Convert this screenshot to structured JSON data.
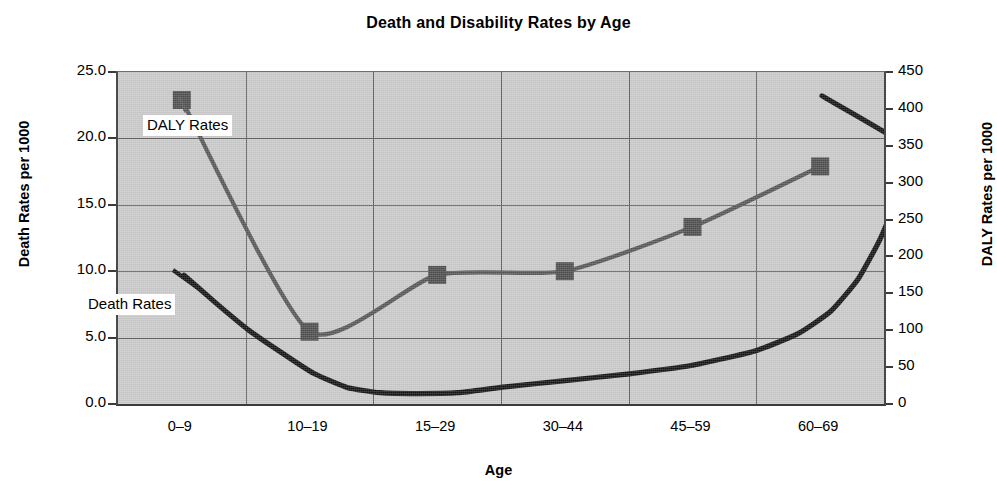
{
  "chart_data": {
    "type": "line",
    "title": "Death and Disability Rates by Age",
    "xlabel": "Age",
    "ylabel": "Death Rates per 1000",
    "y2label": "DALY Rates per 1000",
    "categories": [
      "0–9",
      "10–19",
      "15–29",
      "30–44",
      "45–59",
      "60–69"
    ],
    "ylim": [
      0,
      25
    ],
    "y2lim": [
      0,
      450
    ],
    "yticks": [
      "0.0",
      "5.0",
      "10.0",
      "15.0",
      "20.0",
      "25.0"
    ],
    "ytick_values": [
      0,
      5,
      10,
      15,
      20,
      25
    ],
    "y2ticks": [
      "0",
      "50",
      "100",
      "150",
      "200",
      "250",
      "300",
      "350",
      "400",
      "450"
    ],
    "y2tick_values": [
      0,
      50,
      100,
      150,
      200,
      250,
      300,
      350,
      400,
      450
    ],
    "grid": true,
    "legend_position": "inline-annotations",
    "series": [
      {
        "name": "DALY Rates",
        "axis": "right",
        "color": "#565656",
        "marker": "square",
        "values": [
          412,
          98,
          175,
          180,
          240,
          322
        ]
      },
      {
        "name": "Death Rates",
        "axis": "left",
        "color": "#141414",
        "marker": "none",
        "values": [
          9.7,
          1.3,
          0.8,
          2.6,
          5.3,
          23.2
        ]
      }
    ],
    "annotations": [
      {
        "text": "DALY Rates",
        "series": "DALY Rates"
      },
      {
        "text": "Death Rates",
        "series": "Death Rates"
      }
    ]
  },
  "colors": {
    "plot_background": "#c9c9c9",
    "gridline": "#5e5e5e",
    "axis": "#3a3a3a",
    "daly_series": "#565656",
    "death_series": "#141414",
    "page_background": "#ffffff"
  }
}
